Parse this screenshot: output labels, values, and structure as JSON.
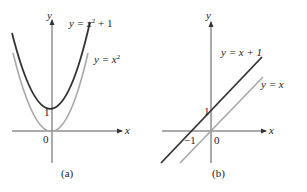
{
  "figure": {
    "panels": [
      {
        "id": "a",
        "caption": "(a)",
        "axes": {
          "x_label": "x",
          "y_label": "y",
          "origin_label": "0",
          "tick_y_label": "1"
        },
        "curves": [
          {
            "name": "upper-parabola",
            "equation": "y = x² + 1",
            "eq_lhs": "y = x",
            "eq_sup": "2",
            "eq_rhs": " + 1",
            "color": "#333333"
          },
          {
            "name": "lower-parabola",
            "equation": "y = x²",
            "eq_lhs": "y = x",
            "eq_sup": "2",
            "eq_rhs": "",
            "color": "#a8a8a8"
          }
        ]
      },
      {
        "id": "b",
        "caption": "(b)",
        "axes": {
          "x_label": "x",
          "y_label": "y",
          "origin_label": "0",
          "tick_y_label": "1",
          "tick_x_label": "−1"
        },
        "curves": [
          {
            "name": "upper-line",
            "equation": "y = x + 1",
            "color": "#333333"
          },
          {
            "name": "lower-line",
            "equation": "y = x",
            "color": "#a8a8a8"
          }
        ]
      }
    ]
  }
}
